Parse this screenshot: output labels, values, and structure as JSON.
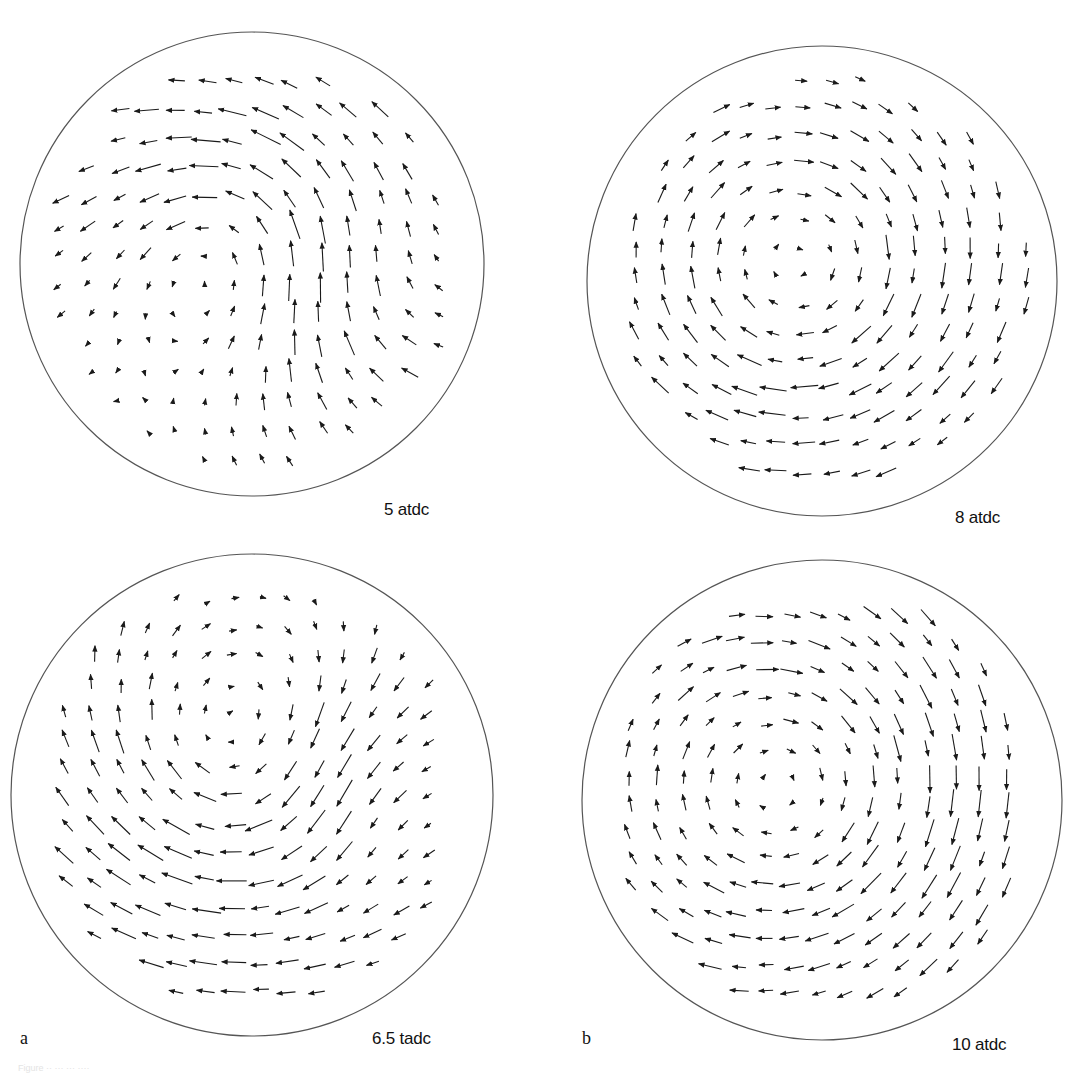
{
  "figure": {
    "stroke_color": "#1a1a1a",
    "circle_color": "#555555",
    "background": "#ffffff",
    "sub_labels": [
      {
        "id": "a",
        "text": "a",
        "x": 20,
        "y": 1040
      },
      {
        "id": "b",
        "text": "b",
        "x": 582,
        "y": 1040
      }
    ],
    "caption": "Figure ·· ··· ··· ····"
  },
  "panels": [
    {
      "id": "p1",
      "label": "5 atdc",
      "label_pos": {
        "x": 384,
        "y": 500
      },
      "circle": {
        "cx": 252,
        "cy": 264,
        "r": 232
      },
      "grid": {
        "spacing": 29,
        "x0": 60,
        "y0": 82,
        "rows": 14,
        "cols": 14
      },
      "vortices": [
        {
          "x": 240,
          "y": 250,
          "strength": -1.0,
          "core": 90
        },
        {
          "x": 360,
          "y": 300,
          "strength": 0.6,
          "core": 80
        }
      ],
      "uniform": {
        "u": -0.5,
        "v": -0.15
      },
      "scale": 22
    },
    {
      "id": "p2",
      "label": "8 atdc",
      "label_pos": {
        "x": 955,
        "y": 518
      },
      "circle": {
        "cx": 822,
        "cy": 281,
        "r": 235
      },
      "grid": {
        "spacing": 28,
        "x0": 635,
        "y0": 80,
        "rows": 15,
        "cols": 15
      },
      "vortices": [
        {
          "x": 800,
          "y": 270,
          "strength": 1.0,
          "core": 110
        }
      ],
      "uniform": {
        "u": -0.1,
        "v": 0.05
      },
      "scale": 22
    },
    {
      "id": "p3",
      "label": "6.5 tadc",
      "label_pos": {
        "x": 372,
        "y": 1040
      },
      "circle": {
        "cx": 252,
        "cy": 795,
        "r": 241
      },
      "grid": {
        "spacing": 28,
        "x0": 65,
        "y0": 600,
        "rows": 15,
        "cols": 14
      },
      "vortices": [
        {
          "x": 250,
          "y": 760,
          "strength": 1.0,
          "core": 110
        },
        {
          "x": 360,
          "y": 780,
          "strength": -0.5,
          "core": 70
        }
      ],
      "uniform": {
        "u": -0.35,
        "v": -0.1
      },
      "scale": 24
    },
    {
      "id": "p4",
      "label": "10 atdc",
      "label_pos": {
        "x": 952,
        "y": 1046
      },
      "circle": {
        "cx": 822,
        "cy": 800,
        "r": 240
      },
      "grid": {
        "spacing": 27,
        "x0": 630,
        "y0": 615,
        "rows": 15,
        "cols": 15
      },
      "vortices": [
        {
          "x": 790,
          "y": 790,
          "strength": 1.0,
          "core": 130
        }
      ],
      "uniform": {
        "u": -0.05,
        "v": 0.15
      },
      "scale": 22
    }
  ]
}
